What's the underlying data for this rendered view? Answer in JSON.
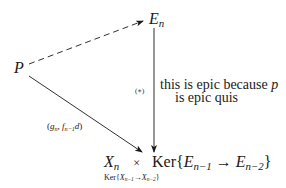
{
  "diagram": {
    "nodes": {
      "P": {
        "base": "P"
      },
      "En": {
        "base": "E",
        "sub": "n"
      },
      "target": {
        "x_base": "X",
        "x_sub": "n",
        "times": "×",
        "ker": "Ker",
        "lbrace": "{",
        "e1_base": "E",
        "e1_sub": "n−1",
        "arrow": "→",
        "e2_base": "E",
        "e2_sub": "n−2",
        "rbrace": "}",
        "under": {
          "ker": "Ker",
          "lbrace": "{",
          "x1_base": "X",
          "x1_sub": "n−1",
          "arrow": "→",
          "x2_base": "X",
          "x2_sub": "n−2",
          "rbrace": "}"
        }
      }
    },
    "edges": {
      "dashed": {
        "from": "P",
        "to": "E_n",
        "style": "dashed"
      },
      "vertical": {
        "from": "E_n",
        "to": "target",
        "label": "(∗)"
      },
      "diagonal": {
        "from": "P",
        "to": "target",
        "label_open": "(",
        "label_g": "g",
        "label_g_sub": "n",
        "label_comma": ", ",
        "label_f": "f",
        "label_f_sub": "n−1",
        "label_d": "d",
        "label_close": ")"
      }
    },
    "annotation": {
      "line1_text": "this is epic because ",
      "line1_var": "p",
      "line2": "is epic quis"
    },
    "colors": {
      "ink": "#1a1a1a",
      "background": "#ffffff"
    }
  }
}
